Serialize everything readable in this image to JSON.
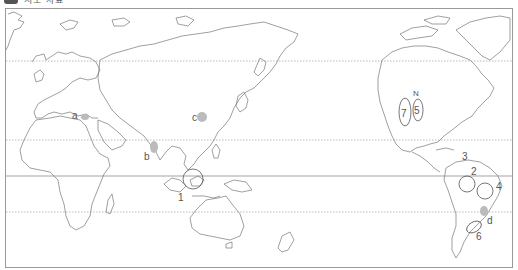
{
  "header": {
    "title": "지도 자료",
    "badge_icon": "map-badge-icon"
  },
  "map": {
    "projection": "world map centered on Pacific (Pacific-centered)",
    "gridlines": [
      {
        "name": "arctic-circle",
        "style": "dotted",
        "y": 61
      },
      {
        "name": "tropic-of-cancer",
        "style": "dotted",
        "y": 140
      },
      {
        "name": "equator",
        "style": "solid",
        "y": 176
      },
      {
        "name": "tropic-of-capricorn",
        "style": "dotted",
        "y": 212
      }
    ],
    "shaded_points": [
      {
        "label": "a",
        "region": "Mediterranean (Italy/Greece)"
      },
      {
        "label": "b",
        "region": "India"
      },
      {
        "label": "c",
        "region": "East China"
      },
      {
        "label": "d",
        "region": "Southern Brazil"
      }
    ],
    "circled_regions": [
      {
        "label": "1",
        "region": "Malay Peninsula / Sumatra"
      },
      {
        "label": "2",
        "region": "Northern Amazon"
      },
      {
        "label": "3",
        "region": "Caribbean coast of South America"
      },
      {
        "label": "4",
        "region": "Northeast Brazil"
      },
      {
        "label": "5",
        "region": "US Midwest (east)"
      },
      {
        "label": "6",
        "region": "Argentine Pampas"
      },
      {
        "label": "7",
        "region": "US Great Plains"
      }
    ],
    "north_arrow_label": "N"
  }
}
